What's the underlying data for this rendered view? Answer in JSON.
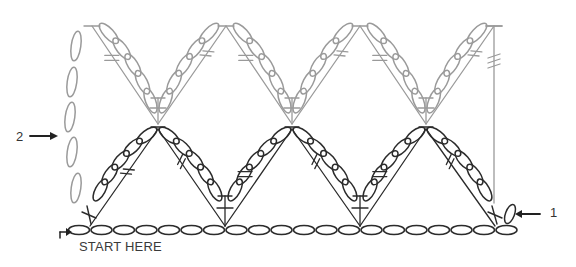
{
  "diagram": {
    "type": "crochet-stitch-chart",
    "header_cut_text": "",
    "labels": {
      "row_2": "2",
      "row_1": "1",
      "start": "START HERE"
    },
    "colors": {
      "row1_stroke": "#2b2b2b",
      "row2_stroke": "#9a9a9a",
      "arrow": "#222222",
      "text": "#333333"
    },
    "foundation_chain": {
      "count": 20,
      "start_x": 79,
      "spacing": 22.5,
      "y": 230,
      "anchors_x": [
        90,
        225,
        360,
        495
      ]
    },
    "row_1": {
      "valleys": [
        {
          "x": 90,
          "y": 226,
          "stitch": "sc"
        },
        {
          "x": 225,
          "y": 226,
          "stitch": "dc"
        },
        {
          "x": 360,
          "y": 226,
          "stitch": "dc"
        },
        {
          "x": 495,
          "y": 226,
          "stitch": "sc"
        }
      ],
      "peaks": [
        {
          "x": 158,
          "y": 127
        },
        {
          "x": 292,
          "y": 127
        },
        {
          "x": 426,
          "y": 127
        }
      ],
      "turning_chain": "1 ch",
      "chain_loops_per_side": 5
    },
    "row_2": {
      "peaks": [
        {
          "x": 92,
          "y": 26
        },
        {
          "x": 226,
          "y": 26
        },
        {
          "x": 360,
          "y": 26
        },
        {
          "x": 494,
          "y": 26
        }
      ],
      "valleys": [
        {
          "x": 158,
          "y": 124
        },
        {
          "x": 292,
          "y": 124
        },
        {
          "x": 426,
          "y": 124
        }
      ],
      "turning_chain_ovals": 5,
      "end_stitch": "tr",
      "chain_loops_per_side": 5
    }
  }
}
